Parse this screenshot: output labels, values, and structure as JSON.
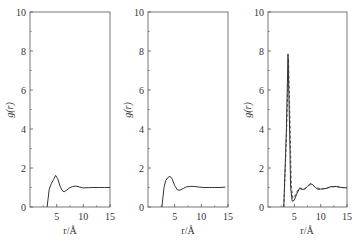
{
  "chart_data": [
    {
      "type": "line",
      "title": "",
      "xlabel": "r/Å",
      "ylabel": "g(r)",
      "xlim": [
        0,
        15
      ],
      "ylim": [
        0,
        10
      ],
      "xticks": [
        5,
        10,
        15
      ],
      "yticks": [
        0,
        2,
        4,
        6,
        8,
        10
      ],
      "grid": false,
      "legend": null,
      "series": [
        {
          "name": "g(r) panel 1",
          "style": "solid",
          "x": [
            3.2,
            3.6,
            4.0,
            4.4,
            4.8,
            5.2,
            5.6,
            6.0,
            6.4,
            6.8,
            7.4,
            8.0,
            8.6,
            9.2,
            10.0,
            11.0,
            12.0,
            13.0,
            14.0,
            15.0
          ],
          "y": [
            0.0,
            0.9,
            1.2,
            1.4,
            1.62,
            1.45,
            1.1,
            0.85,
            0.78,
            0.85,
            0.98,
            1.05,
            1.07,
            1.03,
            0.98,
            0.99,
            1.0,
            1.0,
            1.0,
            1.0
          ]
        }
      ]
    },
    {
      "type": "line",
      "title": "",
      "xlabel": "r/Å",
      "ylabel": "g(r)",
      "xlim": [
        0,
        15
      ],
      "ylim": [
        0,
        10
      ],
      "xticks": [
        5,
        10,
        15
      ],
      "yticks": [
        0,
        2,
        4,
        6,
        8,
        10
      ],
      "grid": false,
      "legend": null,
      "series": [
        {
          "name": "g(r) panel 2",
          "style": "solid",
          "x": [
            2.6,
            3.0,
            3.3,
            3.7,
            4.1,
            4.5,
            5.0,
            5.5,
            6.0,
            6.6,
            7.2,
            8.0,
            8.8,
            9.6,
            10.5,
            11.5,
            12.5,
            13.5,
            14.5
          ],
          "y": [
            0.0,
            1.0,
            1.35,
            1.5,
            1.58,
            1.45,
            1.1,
            0.88,
            0.86,
            0.95,
            1.03,
            1.06,
            1.05,
            1.02,
            1.0,
            1.0,
            1.0,
            1.0,
            1.02
          ]
        }
      ]
    },
    {
      "type": "line",
      "title": "",
      "xlabel": "r/Å",
      "ylabel": "g(r)",
      "xlim": [
        0,
        15
      ],
      "ylim": [
        0,
        10
      ],
      "xticks": [
        5,
        10,
        15
      ],
      "yticks": [
        0,
        2,
        4,
        6,
        8,
        10
      ],
      "grid": false,
      "legend": null,
      "series": [
        {
          "name": "g(r) panel 3 solid",
          "style": "solid",
          "x": [
            3.0,
            3.5,
            3.8,
            4.1,
            4.3,
            4.6,
            5.0,
            5.5,
            6.0,
            6.5,
            7.0,
            7.5,
            8.0,
            8.5,
            9.0,
            9.5,
            10.0,
            11.0,
            12.0,
            13.0,
            14.0,
            15.0
          ],
          "y": [
            0.0,
            4.0,
            7.85,
            4.0,
            1.0,
            0.3,
            0.35,
            0.7,
            0.95,
            0.9,
            0.92,
            1.05,
            1.2,
            1.15,
            1.0,
            0.9,
            0.92,
            0.95,
            1.05,
            1.05,
            1.0,
            0.98
          ]
        },
        {
          "name": "g(r) panel 3 dashed",
          "style": "dashed",
          "x": [
            3.0,
            3.5,
            3.9,
            4.2,
            4.4,
            4.7,
            5.0,
            5.5,
            6.0,
            6.5,
            7.0,
            7.5,
            8.0,
            8.5,
            9.0,
            10.0,
            11.0,
            12.0,
            13.0,
            14.0,
            15.0
          ],
          "y": [
            0.0,
            3.5,
            7.6,
            4.2,
            1.2,
            0.45,
            0.5,
            0.8,
            0.98,
            0.95,
            0.95,
            1.05,
            1.15,
            1.12,
            1.0,
            0.93,
            0.95,
            1.03,
            1.04,
            1.0,
            0.98
          ]
        }
      ]
    }
  ],
  "panels": [
    {
      "ylabel": "g(r)",
      "xlabel": "r/Å"
    },
    {
      "ylabel": "g(r)",
      "xlabel": "r/Å"
    },
    {
      "ylabel": "g(r)",
      "xlabel": "r/Å"
    }
  ],
  "colors": {
    "axis": "#555555",
    "line": "#333333",
    "text": "#333333"
  }
}
